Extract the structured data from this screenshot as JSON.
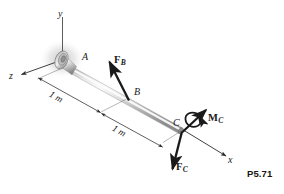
{
  "figure": {
    "number": "P5.71",
    "axes": [
      {
        "name": "y-axis",
        "label": "y"
      },
      {
        "name": "x-axis",
        "label": "x"
      },
      {
        "name": "z-axis",
        "label": "z"
      }
    ],
    "points": [
      {
        "name": "point-a",
        "label": "A"
      },
      {
        "name": "point-b",
        "label": "B"
      },
      {
        "name": "point-c",
        "label": "C"
      }
    ],
    "dimensions": [
      {
        "name": "dimension-a-to-b",
        "label": "1 m"
      },
      {
        "name": "dimension-b-to-c",
        "label": "1 m"
      }
    ],
    "vectors": [
      {
        "name": "force-b",
        "symbol": "F",
        "subscript": "B"
      },
      {
        "name": "force-c",
        "symbol": "F",
        "subscript": "C"
      },
      {
        "name": "moment-c",
        "symbol": "M",
        "subscript": "C"
      }
    ],
    "colors": {
      "ink": "#1a1a1a",
      "line": "#2b2b2b",
      "bar_light": "#f4f4f4",
      "bar_mid": "#c9c9c9",
      "bar_dark": "#8e8e8e",
      "flange": "#9a9a9a",
      "shadow": "#d8d8d8",
      "background": "#ffffff"
    }
  }
}
